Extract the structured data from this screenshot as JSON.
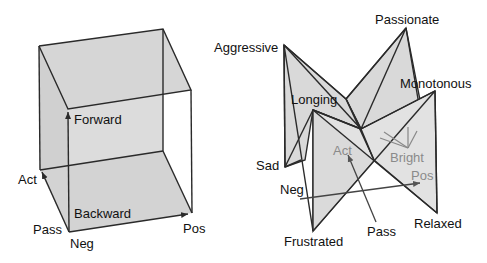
{
  "colors": {
    "face_fill": "#d9d9d9",
    "edge": "#2a2a2a",
    "label": "#111111",
    "gray_label": "#8a8a8a",
    "background": "#ffffff"
  },
  "left_diagram": {
    "labels": {
      "forward": "Forward",
      "backward": "Backward",
      "act": "Act",
      "pass": "Pass",
      "neg": "Neg",
      "pos": "Pos"
    }
  },
  "right_diagram": {
    "labels": {
      "aggressive": "Aggressive",
      "passionate": "Passionate",
      "monotonous": "Monotonous",
      "longing": "Longing",
      "sad": "Sad",
      "neg": "Neg",
      "frustrated": "Frustrated",
      "pass": "Pass",
      "relaxed": "Relaxed",
      "act": "Act",
      "bright": "Bright",
      "pos": "Pos"
    }
  }
}
